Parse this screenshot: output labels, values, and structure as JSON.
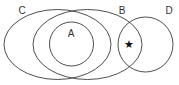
{
  "diagram": {
    "type": "venn",
    "sets": [
      {
        "id": "C",
        "label": "C",
        "shape": "ellipse"
      },
      {
        "id": "B",
        "label": "B",
        "shape": "ellipse"
      },
      {
        "id": "A",
        "label": "A",
        "shape": "circle"
      },
      {
        "id": "D",
        "label": "D",
        "shape": "circle"
      }
    ],
    "marker": {
      "symbol": "★",
      "region": "B ∩ D (outside C)"
    }
  },
  "labels": {
    "c": "C",
    "b": "B",
    "a": "A",
    "d": "D",
    "star": "★"
  },
  "colors": {
    "stroke": "#3a3a3a",
    "text": "#333333",
    "background": "#ffffff"
  }
}
